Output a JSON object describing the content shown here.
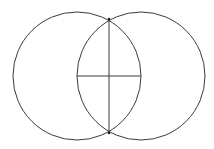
{
  "diagram": {
    "type": "vesica-piscis-construction",
    "stroke_color": "#3a3a3a",
    "point_color": "#222222",
    "background": "#ffffff",
    "circles": [
      {
        "name": "left-circle",
        "cx": 77,
        "cy": 76,
        "r": 64
      },
      {
        "name": "right-circle",
        "cx": 141,
        "cy": 76,
        "r": 64
      }
    ],
    "lines": [
      {
        "name": "vertical-chord",
        "x1": 109,
        "y1": 19,
        "x2": 109,
        "y2": 133
      },
      {
        "name": "center-segment",
        "x1": 77,
        "y1": 76,
        "x2": 141,
        "y2": 76
      }
    ],
    "points": [
      {
        "name": "top-intersection-point",
        "x": 109,
        "y": 19
      },
      {
        "name": "bottom-intersection-point",
        "x": 109,
        "y": 133
      }
    ]
  }
}
